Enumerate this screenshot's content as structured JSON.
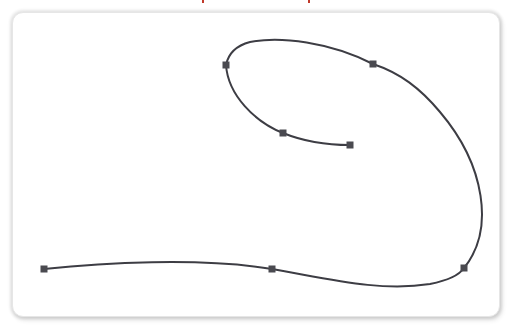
{
  "canvas": {
    "background": "#ffffff",
    "panel_color": "#ffffff",
    "curve_color": "#3d3d44",
    "handle_color": "#4a4a50",
    "handle_size": 7,
    "curve_path": "M 44 269 C 100 263, 200 257, 272 269 C 330 279, 380 292, 430 284 C 450 280, 460 274, 464 268 C 495 230, 485 165, 440 112 C 420 88, 400 73, 373 64 C 330 42, 280 36, 250 42 C 235 46, 228 55, 226 65 C 228 95, 255 122, 283 133 C 305 142, 330 145, 350 145"
  },
  "control_points": [
    {
      "id": "p1",
      "x": 44,
      "y": 269
    },
    {
      "id": "p2",
      "x": 272,
      "y": 269
    },
    {
      "id": "p3",
      "x": 464,
      "y": 268
    },
    {
      "id": "p4",
      "x": 373,
      "y": 64
    },
    {
      "id": "p5",
      "x": 226,
      "y": 65
    },
    {
      "id": "p6",
      "x": 283,
      "y": 133
    },
    {
      "id": "p7",
      "x": 350,
      "y": 145
    }
  ],
  "top_marks": [
    {
      "x": 202
    },
    {
      "x": 308
    }
  ]
}
